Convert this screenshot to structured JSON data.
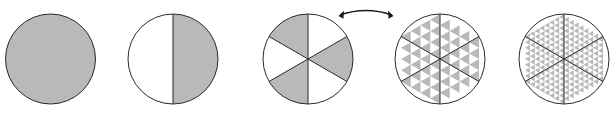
{
  "figure": {
    "type": "diagram",
    "background_color": "#ffffff",
    "width": 612,
    "height": 118,
    "stroke_color": "#2a2a2a",
    "shade_color": "#b9b9b9",
    "unshaded_color": "#ffffff",
    "stroke_width": 1,
    "shapes": [
      {
        "name": "circle-1-full",
        "label": "Level 0 disk",
        "cx": 50.5,
        "cy": 59,
        "r": 45,
        "sectors": 1,
        "subdivision_level": 0,
        "fill": "full",
        "shaded_fraction": "1"
      },
      {
        "name": "circle-2-halves",
        "label": "Level 1 halves",
        "cx": 173,
        "cy": 59,
        "r": 45,
        "sectors": 2,
        "subdivision_level": 1,
        "fill": "right-half",
        "shaded_fraction": "1/2"
      },
      {
        "name": "circle-3-sectors",
        "label": "Level 2 six sectors",
        "cx": 308,
        "cy": 59,
        "r": 45,
        "sectors": 6,
        "subdivision_level": 2,
        "fill": "alternating",
        "shaded_fraction": "1/2"
      },
      {
        "name": "circle-4-triangles",
        "label": "Level 3 triangulation",
        "cx": 440,
        "cy": 59,
        "r": 45,
        "sectors": 6,
        "subdivision_level": 3,
        "triangles_per_sector": 4,
        "fill": "sierpinski",
        "shaded_fraction": "1/2"
      },
      {
        "name": "circle-5-fine-triangles",
        "label": "Level 4 triangulation",
        "cx": 564,
        "cy": 59,
        "r": 45,
        "sectors": 6,
        "subdivision_level": 4,
        "triangles_per_sector": 16,
        "fill": "sierpinski",
        "shaded_fraction": "1/2"
      }
    ],
    "arrow": {
      "name": "double-headed-curved-arrow",
      "x_start": 340,
      "x_end": 392,
      "y": 15,
      "heads": "both",
      "style": "curved",
      "color": "#1a1a1a"
    }
  }
}
